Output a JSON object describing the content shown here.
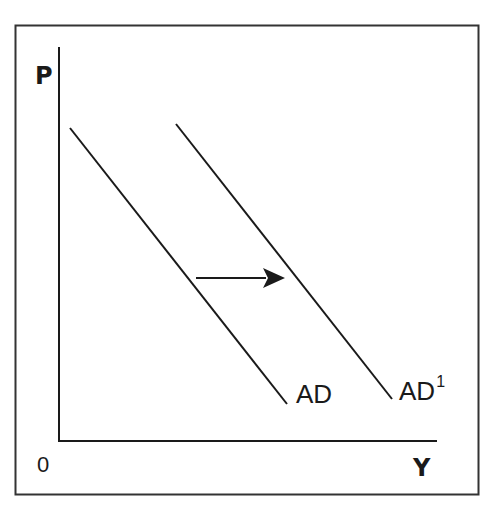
{
  "diagram": {
    "axes": {
      "y_label": "P",
      "x_label": "Y",
      "origin_label": "0"
    },
    "curves": [
      {
        "name": "AD",
        "label": "AD",
        "superscript": "",
        "from": [
          70,
          128
        ],
        "to": [
          287,
          404
        ]
      },
      {
        "name": "AD1",
        "label": "AD",
        "superscript": "1",
        "from": [
          176,
          124
        ],
        "to": [
          392,
          399
        ]
      }
    ],
    "shift_arrow": {
      "direction": "right",
      "from": [
        196,
        278
      ],
      "to": [
        285,
        278
      ]
    },
    "colors": {
      "line": "#1a1a1a",
      "frame": "#333333",
      "background": "#ffffff"
    }
  }
}
